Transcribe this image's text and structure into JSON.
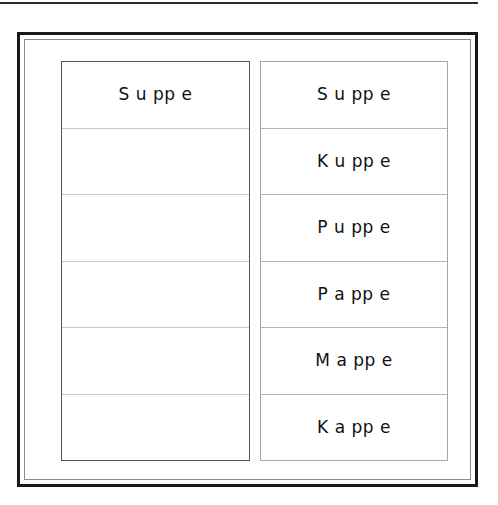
{
  "page": {
    "background_color": "#ffffff",
    "text_color": "#111111"
  },
  "top_rule": {
    "color": "#2b2b2b"
  },
  "frame": {
    "outer_border_color": "#1a1a1a",
    "inner_border_color": "#8c8c8c"
  },
  "panels": [
    {
      "id": "left-panel",
      "name": "blank-answer-column",
      "border_color": "#555555",
      "divider_color": "#c9c9c9",
      "rows": [
        {
          "text": "S u pp e",
          "empty": false
        },
        {
          "text": "",
          "empty": true
        },
        {
          "text": "",
          "empty": true
        },
        {
          "text": "",
          "empty": true
        },
        {
          "text": "",
          "empty": true
        },
        {
          "text": "",
          "empty": true
        }
      ]
    },
    {
      "id": "right-panel",
      "name": "word-list-column",
      "border_color": "#a8a8a8",
      "divider_color": "#b4b4b4",
      "rows": [
        {
          "text": "S u pp e",
          "empty": false
        },
        {
          "text": "K u pp e",
          "empty": false
        },
        {
          "text": "P u pp e",
          "empty": false
        },
        {
          "text": "P a pp e",
          "empty": false
        },
        {
          "text": "M a pp e",
          "empty": false
        },
        {
          "text": "K a pp e",
          "empty": false
        }
      ]
    }
  ]
}
